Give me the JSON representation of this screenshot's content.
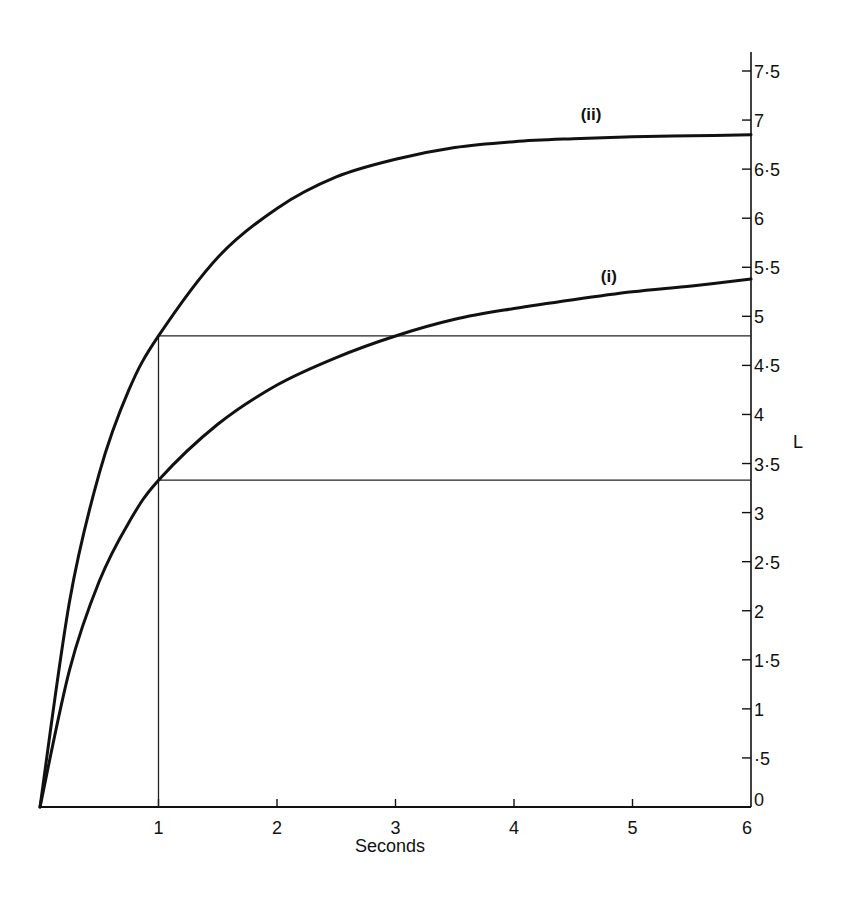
{
  "chart_data": {
    "type": "line",
    "title": "",
    "xlabel": "Seconds",
    "ylabel": "L",
    "xlim": [
      0,
      6
    ],
    "ylim": [
      0,
      7.5
    ],
    "grid": false,
    "x_ticks": [
      "1",
      "2",
      "3",
      "4",
      "5",
      "6"
    ],
    "y_ticks": [
      "0",
      "·5",
      "1",
      "1·5",
      "2",
      "2·5",
      "3",
      "3·5",
      "4",
      "4·5",
      "5",
      "5·5",
      "6",
      "6·5",
      "7",
      "7·5"
    ],
    "y_axis_position": "right",
    "x": [
      0,
      0.25,
      0.5,
      0.75,
      1,
      1.5,
      2,
      2.5,
      3,
      3.5,
      4,
      4.5,
      5,
      5.5,
      6
    ],
    "series": [
      {
        "name": "(i)",
        "values": [
          0,
          1.4,
          2.3,
          2.9,
          3.33,
          3.9,
          4.3,
          4.58,
          4.8,
          4.97,
          5.08,
          5.17,
          5.25,
          5.31,
          5.38
        ]
      },
      {
        "name": "(ii)",
        "values": [
          0,
          2.1,
          3.4,
          4.25,
          4.8,
          5.6,
          6.1,
          6.42,
          6.6,
          6.72,
          6.78,
          6.81,
          6.83,
          6.84,
          6.85
        ]
      }
    ],
    "reference_lines": [
      {
        "type": "vertical",
        "x": 1,
        "from_y": 0,
        "to_y": 4.8
      },
      {
        "type": "horizontal",
        "y": 4.8,
        "from_x": 1,
        "to_x": 6
      },
      {
        "type": "horizontal",
        "y": 3.33,
        "from_x": 1,
        "to_x": 6
      }
    ],
    "annotations": [
      {
        "text": "(i)",
        "x": 4.8,
        "y": 5.35
      },
      {
        "text": "(ii)",
        "x": 4.65,
        "y": 7.0
      }
    ]
  }
}
